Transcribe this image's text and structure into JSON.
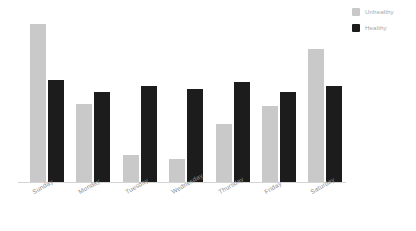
{
  "chart_data": {
    "type": "bar",
    "title": "",
    "subtitle": "",
    "xlabel": "",
    "ylabel": "",
    "grid": false,
    "legend_position": "top-right",
    "ylim": [
      0,
      150
    ],
    "categories": [
      "Sunday",
      "Monday",
      "Tuesday",
      "Wednesday",
      "Thursday",
      "Friday",
      "Saturday"
    ],
    "series": [
      {
        "name": "Unhealthy",
        "color": "#c9c9c9",
        "values": [
          146,
          72,
          25,
          21,
          54,
          70,
          123
        ]
      },
      {
        "name": "Healthy",
        "color": "#1c1c1c",
        "values": [
          94,
          83,
          89,
          86,
          93,
          83,
          89
        ]
      }
    ]
  },
  "legend": {
    "items": [
      {
        "label": "Unhealthy",
        "color": "#c9c9c9"
      },
      {
        "label": "Healthy",
        "color": "#1c1c1c"
      }
    ]
  },
  "axis": {
    "baseline_color": "#d4d4d4",
    "tick_labels": [
      "Sunday",
      "Monday",
      "Tuesday",
      "Wednesday",
      "Thursday",
      "Friday",
      "Saturday"
    ]
  },
  "colors": {
    "background": "#ffffff",
    "unhealthy": "#c9c9c9",
    "healthy": "#1c1c1c",
    "label_text": "#8f8f8f",
    "legend_text": "#a8a8a8"
  }
}
